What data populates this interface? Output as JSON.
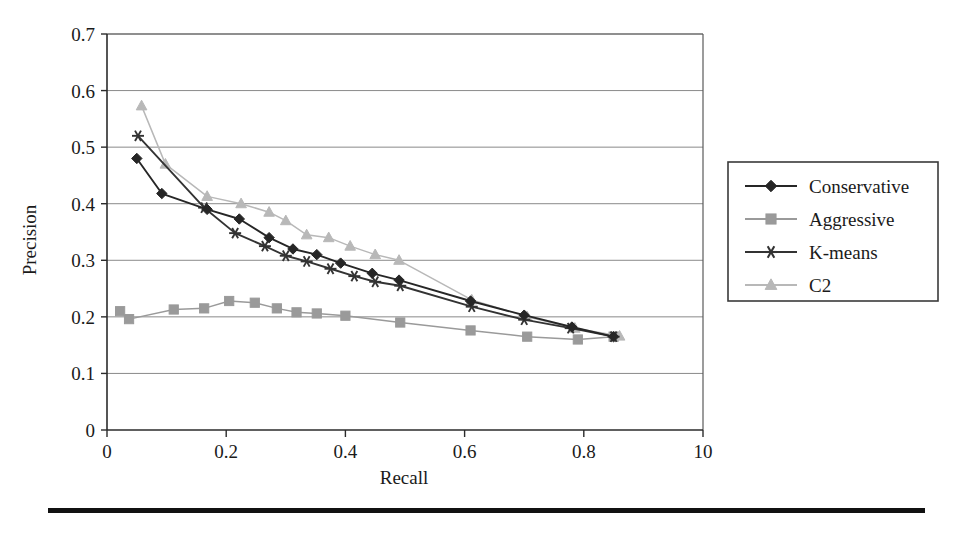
{
  "chart_data": {
    "type": "line",
    "title": "",
    "xlabel": "Recall",
    "ylabel": "Precision",
    "xlim": [
      0,
      1
    ],
    "ylim": [
      0,
      0.7
    ],
    "grid": true,
    "legend_position": "right-outside",
    "x_tick_labels": [
      "0",
      "0.2",
      "0.4",
      "0.6",
      "0.8",
      "10"
    ],
    "x_ticks": [
      0,
      0.2,
      0.4,
      0.6,
      0.8,
      1.0
    ],
    "y_tick_labels": [
      "0",
      "0.1",
      "0.2",
      "0.3",
      "0.4",
      "0.5",
      "0.6",
      "0.7"
    ],
    "y_ticks": [
      0,
      0.1,
      0.2,
      0.3,
      0.4,
      0.5,
      0.6,
      0.7
    ],
    "series": [
      {
        "name": "Conservative",
        "color": "#262626",
        "marker": "diamond",
        "points": [
          [
            0.05,
            0.48
          ],
          [
            0.092,
            0.418
          ],
          [
            0.168,
            0.39
          ],
          [
            0.222,
            0.373
          ],
          [
            0.272,
            0.34
          ],
          [
            0.312,
            0.32
          ],
          [
            0.352,
            0.31
          ],
          [
            0.392,
            0.295
          ],
          [
            0.445,
            0.277
          ],
          [
            0.49,
            0.265
          ],
          [
            0.61,
            0.228
          ],
          [
            0.7,
            0.203
          ],
          [
            0.78,
            0.182
          ],
          [
            0.85,
            0.165
          ]
        ]
      },
      {
        "name": "Aggressive",
        "color": "#9a9a9a",
        "marker": "square",
        "points": [
          [
            0.022,
            0.21
          ],
          [
            0.037,
            0.196
          ],
          [
            0.112,
            0.213
          ],
          [
            0.163,
            0.215
          ],
          [
            0.205,
            0.228
          ],
          [
            0.248,
            0.225
          ],
          [
            0.285,
            0.215
          ],
          [
            0.318,
            0.208
          ],
          [
            0.352,
            0.206
          ],
          [
            0.4,
            0.202
          ],
          [
            0.492,
            0.19
          ],
          [
            0.61,
            0.176
          ],
          [
            0.705,
            0.165
          ],
          [
            0.79,
            0.16
          ],
          [
            0.85,
            0.165
          ]
        ]
      },
      {
        "name": "K-means",
        "color": "#333333",
        "marker": "asterisk",
        "points": [
          [
            0.052,
            0.52
          ],
          [
            0.163,
            0.393
          ],
          [
            0.215,
            0.348
          ],
          [
            0.265,
            0.325
          ],
          [
            0.3,
            0.308
          ],
          [
            0.335,
            0.298
          ],
          [
            0.375,
            0.285
          ],
          [
            0.415,
            0.272
          ],
          [
            0.45,
            0.262
          ],
          [
            0.492,
            0.255
          ],
          [
            0.612,
            0.218
          ],
          [
            0.7,
            0.195
          ],
          [
            0.778,
            0.18
          ],
          [
            0.85,
            0.165
          ]
        ]
      },
      {
        "name": "C2",
        "color": "#b8b8b8",
        "marker": "triangle",
        "points": [
          [
            0.058,
            0.573
          ],
          [
            0.098,
            0.47
          ],
          [
            0.168,
            0.413
          ],
          [
            0.225,
            0.4
          ],
          [
            0.272,
            0.385
          ],
          [
            0.3,
            0.37
          ],
          [
            0.335,
            0.345
          ],
          [
            0.372,
            0.34
          ],
          [
            0.408,
            0.325
          ],
          [
            0.45,
            0.31
          ],
          [
            0.49,
            0.3
          ],
          [
            0.612,
            0.23
          ],
          [
            0.705,
            0.2
          ],
          [
            0.785,
            0.18
          ],
          [
            0.86,
            0.166
          ]
        ]
      }
    ]
  },
  "legend": {
    "entries": [
      {
        "label": "Conservative"
      },
      {
        "label": "Aggressive"
      },
      {
        "label": "K-means"
      },
      {
        "label": "C2"
      }
    ]
  },
  "icons": {
    "diamond_marker": "diamond-marker-icon",
    "square_marker": "square-marker-icon",
    "asterisk_marker": "asterisk-marker-icon",
    "triangle_marker": "triangle-marker-icon"
  },
  "colors": {
    "conservative": "#262626",
    "aggressive": "#9a9a9a",
    "kmeans": "#333333",
    "c2": "#b8b8b8",
    "gridline": "#8a8a8a",
    "axis": "#2b2b2b",
    "background": "#ffffff"
  }
}
